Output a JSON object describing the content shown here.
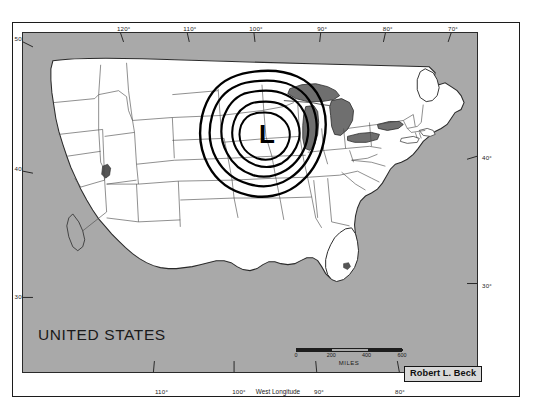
{
  "figure": {
    "country_label": "UNITED STATES",
    "credit": "Robert L. Beck",
    "x_axis_caption": "West Longitude",
    "scale_units": "MILES"
  },
  "axes": {
    "top_longitude_ticks": [
      {
        "label": "120°",
        "x_pct": 22.1
      },
      {
        "label": "110°",
        "x_pct": 36.6
      },
      {
        "label": "100°",
        "x_pct": 51.1
      },
      {
        "label": "90°",
        "x_pct": 65.6
      },
      {
        "label": "80°",
        "x_pct": 80.0
      },
      {
        "label": "70°",
        "x_pct": 94.3
      }
    ],
    "bottom_longitude_ticks": [
      {
        "label": "110°",
        "x_pct": 31.0
      },
      {
        "label": "100°",
        "x_pct": 48.2
      },
      {
        "label": "90°",
        "x_pct": 66.0
      },
      {
        "label": "80°",
        "x_pct": 84.0
      }
    ],
    "left_latitude_ticks": [
      {
        "label": "50°",
        "y_pct": 2.6
      },
      {
        "label": "40°",
        "y_pct": 40.4
      },
      {
        "label": "30°",
        "y_pct": 77.5
      }
    ],
    "right_latitude_ticks": [
      {
        "label": "40°",
        "y_pct": 36.0
      },
      {
        "label": "30°",
        "y_pct": 73.5
      }
    ]
  },
  "scale_bar": {
    "ticks": [
      "0",
      "200",
      "400",
      "600"
    ],
    "units": "MILES"
  },
  "weather": {
    "pressure_center_symbol": "L",
    "contour_count": 5
  },
  "colors": {
    "background_gray": "#a9a9a9",
    "land_fill": "#ffffff",
    "lakes_fill": "#6f6f6f",
    "outline": "#2a2a2a",
    "frame": "#1c1c1c",
    "isobar": "#000000"
  }
}
